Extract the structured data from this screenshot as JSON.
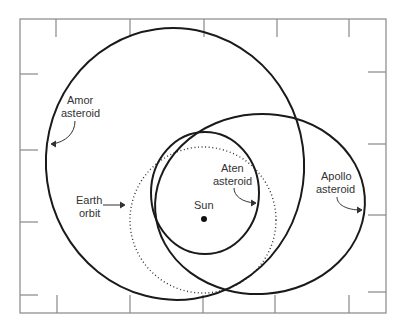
{
  "diagram": {
    "type": "orbit-diagram",
    "frame": {
      "x": 20,
      "y": 19,
      "width": 366,
      "height": 294,
      "color": "#888888"
    },
    "colors": {
      "orbit": "#1a1a1a",
      "frame": "#888888",
      "text": "#333333"
    },
    "sun": {
      "label": "Sun",
      "x": 204,
      "y": 219
    },
    "orbits": [
      {
        "id": "amor",
        "label_line1": "Amor",
        "label_line2": "asteroid",
        "style": "solid",
        "cx": 175,
        "cy": 164,
        "rx": 129,
        "ry": 136
      },
      {
        "id": "aten",
        "label_line1": "Aten",
        "label_line2": "asteroid",
        "style": "solid",
        "cx": 205,
        "cy": 193,
        "rx": 54,
        "ry": 61
      },
      {
        "id": "apollo",
        "label_line1": "Apollo",
        "label_line2": "asteroid",
        "style": "solid",
        "cx": 260,
        "cy": 204,
        "rx": 105,
        "ry": 90
      },
      {
        "id": "earth",
        "label_line1": "Earth",
        "label_line2": "orbit",
        "style": "dotted",
        "cx": 203,
        "cy": 220,
        "rx": 73,
        "ry": 73
      }
    ]
  }
}
